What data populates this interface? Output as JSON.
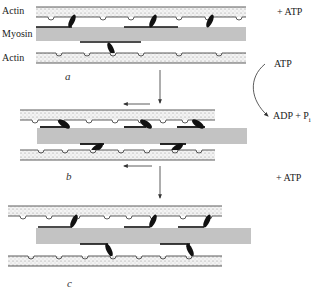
{
  "labels": {
    "actin_top": "Actin",
    "myosin": "Myosin",
    "actin_bottom": "Actin"
  },
  "panels": [
    {
      "letter": "a"
    },
    {
      "letter": "b"
    },
    {
      "letter": "c"
    }
  ],
  "reactions": {
    "step1": "+ ATP",
    "hydrolysis_in": "ATP",
    "hydrolysis_out": "ADP + P",
    "hydrolysis_out_sub": "i",
    "step2": "+ ATP"
  },
  "colors": {
    "line": "#333333",
    "stipple": "#9a9a9a",
    "head": "#111111"
  }
}
